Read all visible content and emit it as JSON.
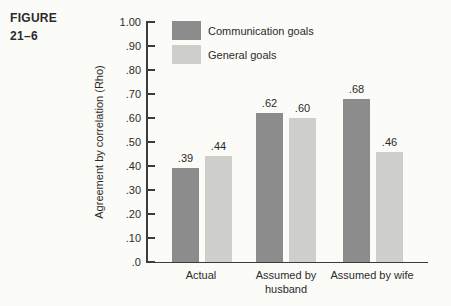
{
  "figure_label": {
    "line1": "FIGURE",
    "line2": "21–6"
  },
  "chart_data": {
    "type": "bar",
    "title": "",
    "xlabel": "",
    "ylabel": "Agreement by correlation (Rho)",
    "ylim": [
      0,
      1.0
    ],
    "yticks": [
      "1.00",
      ".90",
      ".80",
      ".70",
      ".60",
      ".50",
      ".40",
      ".30",
      ".20",
      ".10",
      ".0"
    ],
    "grid": false,
    "legend_position": "top-left-inside",
    "categories": [
      "Actual",
      "Assumed by husband",
      "Assumed by wife"
    ],
    "series": [
      {
        "name": "Communication goals",
        "color": "#8c8c8c",
        "values": [
          0.39,
          0.62,
          0.68
        ],
        "labels": [
          ".39",
          ".62",
          ".68"
        ]
      },
      {
        "name": "General goals",
        "color": "#cecfca",
        "values": [
          0.44,
          0.6,
          0.46
        ],
        "labels": [
          ".44",
          ".60",
          ".46"
        ]
      }
    ]
  }
}
